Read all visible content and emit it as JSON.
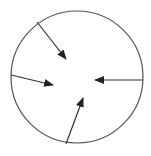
{
  "diagram": {
    "background": "#ffffff",
    "circle": {
      "cx": 77,
      "cy": 77,
      "r": 66,
      "stroke": "#555555",
      "stroke_width": 1.2
    },
    "arrows": [
      {
        "name": "arrow-top-left",
        "x1": 37,
        "y1": 22,
        "x2": 66,
        "y2": 59
      },
      {
        "name": "arrow-left",
        "x1": 11,
        "y1": 75,
        "x2": 53,
        "y2": 85
      },
      {
        "name": "arrow-right",
        "x1": 143,
        "y1": 80,
        "x2": 95,
        "y2": 80
      },
      {
        "name": "arrow-bottom",
        "x1": 66,
        "y1": 144,
        "x2": 83,
        "y2": 98
      }
    ],
    "arrow_style": {
      "stroke": "#333333",
      "stroke_width": 1.2,
      "head_color": "#222222"
    }
  }
}
